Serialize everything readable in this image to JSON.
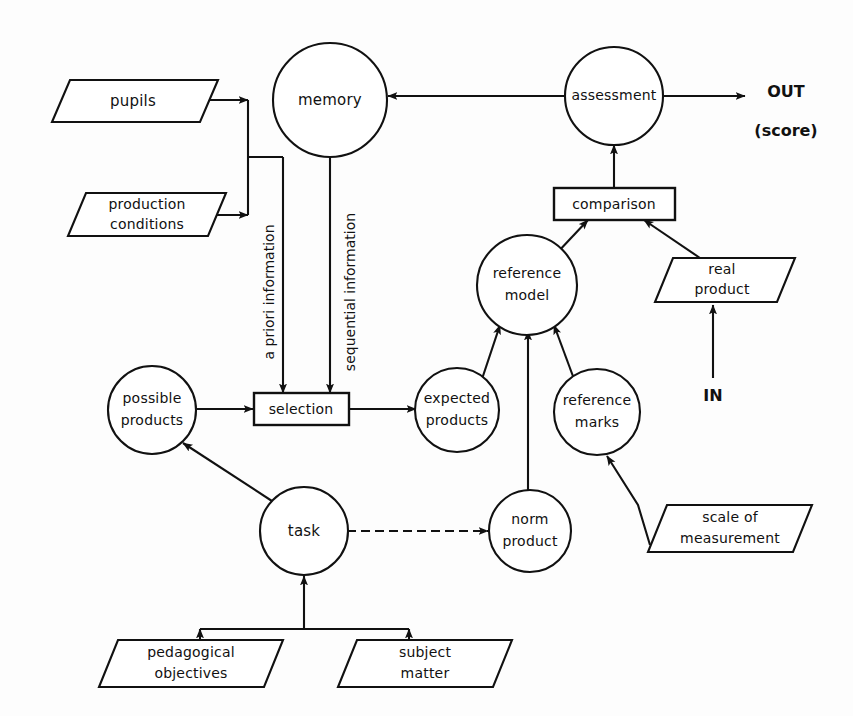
{
  "diagram": {
    "background_color": "#fdfdfd",
    "line_color": "#111111",
    "nodes": {
      "pupils": {
        "label": "pupils",
        "shape": "parallelogram"
      },
      "production_conditions": {
        "label_line1": "production",
        "label_line2": "conditions",
        "shape": "parallelogram"
      },
      "memory": {
        "label": "memory",
        "shape": "circle"
      },
      "assessment": {
        "label": "assessment",
        "shape": "circle"
      },
      "comparison": {
        "label": "comparison",
        "shape": "rectangle"
      },
      "reference_model": {
        "label_line1": "reference",
        "label_line2": "model",
        "shape": "circle"
      },
      "real_product": {
        "label_line1": "real",
        "label_line2": "product",
        "shape": "parallelogram"
      },
      "possible_products": {
        "label_line1": "possible",
        "label_line2": "products",
        "shape": "circle"
      },
      "selection": {
        "label": "selection",
        "shape": "rectangle"
      },
      "expected_products": {
        "label_line1": "expected",
        "label_line2": "products",
        "shape": "circle"
      },
      "reference_marks": {
        "label_line1": "reference",
        "label_line2": "marks",
        "shape": "circle"
      },
      "task": {
        "label": "task",
        "shape": "circle"
      },
      "norm_product": {
        "label_line1": "norm",
        "label_line2": "product",
        "shape": "circle"
      },
      "scale_of_measurement": {
        "label_line1": "scale of",
        "label_line2": "measurement",
        "shape": "parallelogram"
      },
      "pedagogical_objectives": {
        "label_line1": "pedagogical",
        "label_line2": "objectives",
        "shape": "parallelogram"
      },
      "subject_matter": {
        "label_line1": "subject",
        "label_line2": "matter",
        "shape": "parallelogram"
      }
    },
    "terminals": {
      "out": {
        "label": "OUT",
        "sublabel": "(score)"
      },
      "in": {
        "label": "IN"
      }
    },
    "edge_labels": {
      "a_priori_information": "a priori information",
      "sequential_information": "sequential information"
    }
  }
}
